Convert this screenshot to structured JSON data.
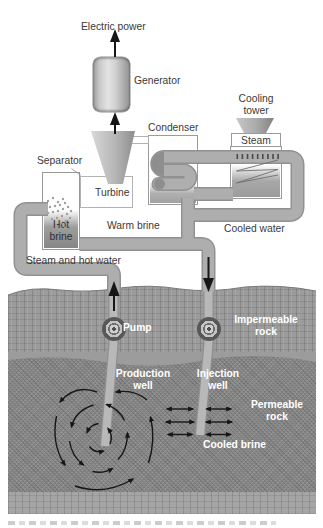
{
  "figure": {
    "labels": {
      "electric_power": "Electric power",
      "generator": "Generator",
      "condenser": "Condenser",
      "cooling_tower_l1": "Cooling",
      "cooling_tower_l2": "tower",
      "steam": "Steam",
      "separator": "Separator",
      "turbine": "Turbine",
      "hot_brine_l1": "Hot",
      "hot_brine_l2": "brine",
      "warm_brine": "Warm brine",
      "cooled_water": "Cooled water",
      "steam_and_hot_water": "Steam and hot water",
      "pump": "Pump",
      "impermeable_rock_l1": "Impermeable",
      "impermeable_rock_l2": "rock",
      "production_well_l1": "Production",
      "production_well_l2": "well",
      "injection_well_l1": "Injection",
      "injection_well_l2": "well",
      "permeable_rock_l1": "Permeable",
      "permeable_rock_l2": "rock",
      "cooled_brine": "Cooled brine"
    },
    "colors": {
      "pipe_fill": "#aeaeae",
      "pipe_edge": "#919191",
      "well_fill": "#b8b8b8",
      "impermeable_rock": "#9c9c9c",
      "permeable_rock": "#8a8a8a",
      "label_text": "#3a3a3a",
      "underground_label_text": "#ffffff",
      "arrow": "#161616"
    }
  }
}
